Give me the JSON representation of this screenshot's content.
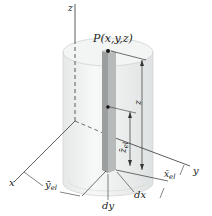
{
  "figure": {
    "labels": {
      "z_axis": "z",
      "x_axis": "x",
      "y_axis": "y",
      "point": "P(x,y,z)",
      "z_height": "z",
      "z_el": "z̄",
      "z_el_sub": "el",
      "x_el": "x̄",
      "x_el_sub": "el",
      "y_el": "ȳ",
      "y_el_sub": "el",
      "dx": "dx",
      "dy": "dy"
    },
    "colors": {
      "cylinder_fill": "#eceeee",
      "cylinder_top": "#f4f5f5",
      "element_fill": "#b9bcbc",
      "element_dark": "#8e9292",
      "lines": "#333333"
    }
  }
}
